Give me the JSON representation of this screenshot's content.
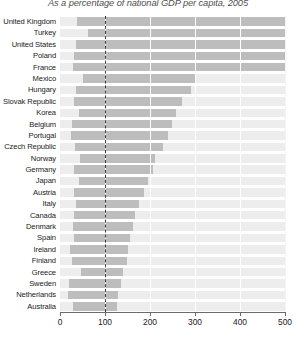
{
  "chart_data": {
    "type": "bar",
    "orientation": "horizontal",
    "title": "As a percentage of national GDP per capita, 2005",
    "subtitle": "",
    "xlabel": "",
    "ylabel": "",
    "xlim": [
      0,
      500
    ],
    "ylim": null,
    "grid": true,
    "gridlines_x": [
      100,
      200,
      300,
      400,
      500
    ],
    "legend": null,
    "legend_position": "none",
    "reference_line": {
      "value": 100,
      "style": "dashed",
      "color": "#3a3a3a",
      "label": ""
    },
    "xticks": [
      0,
      100,
      200,
      300,
      400,
      500
    ],
    "xticklabels": [
      "0",
      "100",
      "200",
      "300",
      "400",
      "500"
    ],
    "categories": [
      "United Kingdom",
      "Turkey",
      "United States",
      "Poland",
      "France",
      "Mexico",
      "Hungary",
      "Slovak Republic",
      "Korea",
      "Belgium",
      "Portugal",
      "Czech Republic",
      "Norway",
      "Germany",
      "Japan",
      "Austria",
      "Italy",
      "Canada",
      "Denmark",
      "Spain",
      "Ireland",
      "Finland",
      "Greece",
      "Sweden",
      "Netherlands",
      "Australia"
    ],
    "bar_kind": "floating-range",
    "series": [
      {
        "name": "Range (low to high)",
        "color": "#bdbdbd",
        "track_color": "#ededed",
        "ranges": [
          [
            38,
            500
          ],
          [
            62,
            500
          ],
          [
            36,
            500
          ],
          [
            32,
            500
          ],
          [
            28,
            500
          ],
          [
            50,
            300
          ],
          [
            36,
            292
          ],
          [
            32,
            272
          ],
          [
            42,
            258
          ],
          [
            26,
            250
          ],
          [
            24,
            240
          ],
          [
            34,
            230
          ],
          [
            44,
            212
          ],
          [
            30,
            206
          ],
          [
            42,
            196
          ],
          [
            30,
            186
          ],
          [
            36,
            176
          ],
          [
            32,
            166
          ],
          [
            28,
            162
          ],
          [
            32,
            156
          ],
          [
            22,
            152
          ],
          [
            26,
            150
          ],
          [
            46,
            140
          ],
          [
            20,
            136
          ],
          [
            18,
            130
          ],
          [
            28,
            126
          ]
        ]
      }
    ],
    "values_note": "Each bar is a floating range shown as a grey band over a light 0-500 track; the dashed vertical line marks 100% of national GDP per capita."
  },
  "axis": {
    "tick_color": "#6b6b6b",
    "label_color": "#222222"
  },
  "colors": {
    "bar": "#bdbdbd",
    "track": "#ededed",
    "grid": "#ffffff",
    "reference": "#3a3a3a",
    "background": "#ffffff",
    "title": "#4f4f4f"
  }
}
